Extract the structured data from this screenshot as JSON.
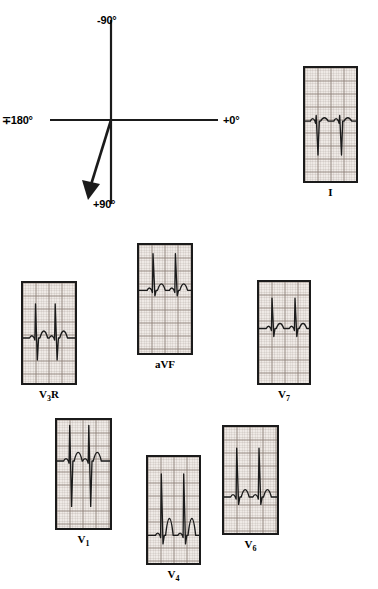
{
  "figure": {
    "background_color": "#ffffff",
    "ink_color": "#1b1b1b",
    "paper_color": "#efeae6",
    "grid_color": "#8c8078"
  },
  "axis_diagram": {
    "name": "qrs-axis-reference-frame",
    "labels": {
      "superior": "-90°",
      "inferior": "+90°",
      "left": "∓180°",
      "right": "+0°"
    },
    "vector": {
      "name": "qrs-axis-vector",
      "angle_degrees": 103,
      "direction": "inferior and slightly leftward",
      "has_arrowhead": true
    },
    "horizontal_axis_degrees": [
      180,
      0
    ],
    "vertical_axis_degrees": [
      -90,
      90
    ]
  },
  "strips": [
    {
      "id": "lead-i",
      "label": "I",
      "label_html": "I",
      "x": 303,
      "y": 66,
      "w": 55,
      "h": 117,
      "caption_top": 120,
      "qrs": "small rS / predominantly negative deflection, low voltage",
      "beats": 2,
      "baseline_frac": 0.47,
      "r_amp": 0.05,
      "s_amp": 0.3,
      "t_amp": 0.03,
      "beat_x": [
        0.22,
        0.68
      ]
    },
    {
      "id": "lead-v3r",
      "label": "V3R",
      "label_html": "V<sub>3</sub>R",
      "x": 21,
      "y": 281,
      "w": 56,
      "h": 104,
      "caption_top": 107,
      "qrs": "tall R with deep S, rSR' pattern right precordial",
      "beats": 2,
      "baseline_frac": 0.55,
      "r_amp": 0.34,
      "s_amp": 0.22,
      "t_amp": 0.07,
      "beat_x": [
        0.24,
        0.62
      ]
    },
    {
      "id": "lead-avf",
      "label": "aVF",
      "label_html": "aVF",
      "x": 137,
      "y": 243,
      "w": 56,
      "h": 112,
      "caption_top": 115,
      "qrs": "tall R waves, dominant positive inferior lead",
      "beats": 2,
      "baseline_frac": 0.42,
      "r_amp": 0.34,
      "s_amp": 0.05,
      "t_amp": 0.06,
      "beat_x": [
        0.27,
        0.7
      ]
    },
    {
      "id": "lead-v7",
      "label": "V7",
      "label_html": "V<sub>7</sub>",
      "x": 257,
      "y": 280,
      "w": 54,
      "h": 105,
      "caption_top": 108,
      "qrs": "tall narrow R with small s, lateral posterior lead",
      "beats": 2,
      "baseline_frac": 0.46,
      "r_amp": 0.3,
      "s_amp": 0.08,
      "t_amp": 0.05,
      "beat_x": [
        0.26,
        0.72
      ]
    },
    {
      "id": "lead-v1",
      "label": "V1",
      "label_html": "V<sub>1</sub>",
      "x": 55,
      "y": 418,
      "w": 57,
      "h": 112,
      "caption_top": 115,
      "qrs": "tall R wave with deep S, large biphasic complexes",
      "beats": 2,
      "baseline_frac": 0.38,
      "r_amp": 0.33,
      "s_amp": 0.42,
      "t_amp": 0.08,
      "beat_x": [
        0.24,
        0.6
      ]
    },
    {
      "id": "lead-v4",
      "label": "V4",
      "label_html": "V<sub>4</sub>",
      "x": 146,
      "y": 455,
      "w": 55,
      "h": 110,
      "caption_top": 113,
      "qrs": "tall R waves with prominent T waves",
      "beats": 2,
      "baseline_frac": 0.74,
      "r_amp": 0.58,
      "s_amp": 0.08,
      "t_amp": 0.16,
      "beat_x": [
        0.26,
        0.7
      ]
    },
    {
      "id": "lead-v6",
      "label": "V6",
      "label_html": "V<sub>6</sub>",
      "x": 222,
      "y": 425,
      "w": 57,
      "h": 110,
      "caption_top": 113,
      "qrs": "tall R waves with small s, upsloping baseline",
      "beats": 2,
      "baseline_frac": 0.66,
      "r_amp": 0.46,
      "s_amp": 0.07,
      "t_amp": 0.07,
      "beat_x": [
        0.24,
        0.66
      ]
    }
  ]
}
